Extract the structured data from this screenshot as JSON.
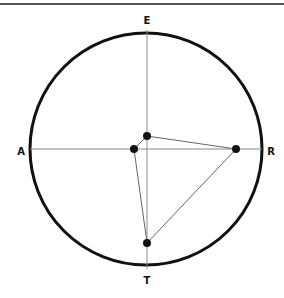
{
  "diagram": {
    "labels": {
      "top": "E",
      "left": "A",
      "right": "R",
      "bottom": "T"
    },
    "colors": {
      "circle": "#111111",
      "axes": "#888888",
      "edges": "#666666",
      "points": "#111111",
      "rule": "#555555"
    },
    "points": [
      {
        "id": "p1",
        "x": 147,
        "y": 136
      },
      {
        "id": "p2",
        "x": 134,
        "y": 149
      },
      {
        "id": "p3",
        "x": 236,
        "y": 149
      },
      {
        "id": "p4",
        "x": 147,
        "y": 243
      }
    ],
    "edges": [
      [
        "p1",
        "p3"
      ],
      [
        "p3",
        "p4"
      ],
      [
        "p4",
        "p2"
      ],
      [
        "p2",
        "p1"
      ]
    ]
  }
}
